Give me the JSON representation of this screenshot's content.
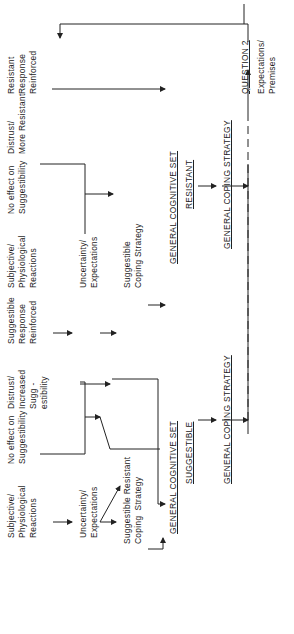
{
  "diagram": {
    "orientation": "rotated 90 degrees counter-clockwise",
    "left_branch": {
      "initial_reactions": "Subjective/\nPhysiological\nReactions",
      "uncertainty": "Uncertainty/\nExpectations",
      "coping_strategy": "Suggestible Resistant\nCoping  Strategy",
      "no_effect": "No effect on\nSuggestibility",
      "distrust": "Distrust/\nIncreased\nSugg -\nestibility",
      "suggestible_response": "Suggestible\nResponse\nReinforced",
      "cognitive_set": "GENERAL COGNITIVE SET",
      "cognitive_set_type": "SUGGESTIBLE",
      "general_coping": "GENERAL COPING STRATEGY"
    },
    "right_branch": {
      "initial_reactions": "Subjective/\nPhysiological\nReactions",
      "uncertainty": "Uncertainty/\nExpectations",
      "coping_strategy": "Suggestible\nCoping Strategy",
      "no_effect": "No effect on\nSuggestibility",
      "distrust": "Distrust/\nMore Resistant",
      "resistant_response": "Resistant\nResponse\nReinforced",
      "cognitive_set": "GENERAL COGNITIVE SET",
      "cognitive_set_type": "RESISTANT",
      "general_coping": "GENERAL COPING STRATEGY"
    },
    "question": {
      "label": "QUESTION 2",
      "sub": "Expectations/\nPremises"
    }
  }
}
